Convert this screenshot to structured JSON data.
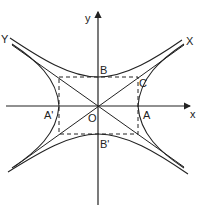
{
  "figure": {
    "type": "conjugate hyperbolas with asymptotes",
    "labels": {
      "y_axis": "y",
      "x_axis": "x",
      "asymptote_X": "X",
      "asymptote_Y": "Y",
      "vertex_B": "B",
      "vertex_B_prime": "B'",
      "vertex_A": "A",
      "vertex_A_prime": "A'",
      "corner_C": "C",
      "origin": "O"
    },
    "colors": {
      "line": "#222222",
      "background": "#ffffff"
    }
  }
}
